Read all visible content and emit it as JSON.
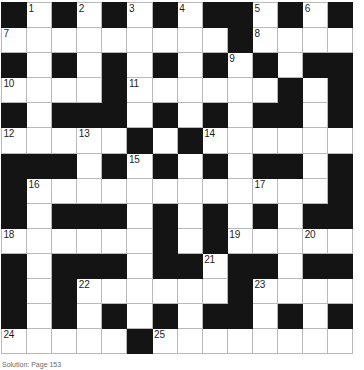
{
  "puzzle": {
    "kind": "crossword-grid",
    "rows": 14,
    "columns": 14,
    "cell_size_px": 25,
    "colors": {
      "block": "#141414",
      "cell": "#ffffff",
      "gridline": "#b9b9b9",
      "number": "#1d1d1d"
    },
    "legend": {
      "white": 0,
      "black": 1
    },
    "layout": [
      [
        1,
        0,
        1,
        0,
        1,
        0,
        1,
        0,
        1,
        1,
        0,
        1,
        0,
        1
      ],
      [
        0,
        0,
        0,
        0,
        0,
        0,
        0,
        0,
        0,
        1,
        0,
        0,
        0,
        0
      ],
      [
        1,
        0,
        1,
        0,
        1,
        0,
        1,
        0,
        1,
        0,
        1,
        0,
        1,
        1
      ],
      [
        0,
        0,
        0,
        0,
        1,
        0,
        0,
        0,
        0,
        0,
        0,
        1,
        0,
        1
      ],
      [
        1,
        0,
        1,
        1,
        1,
        0,
        1,
        0,
        1,
        0,
        1,
        1,
        0,
        1
      ],
      [
        0,
        0,
        0,
        0,
        0,
        1,
        0,
        1,
        0,
        0,
        0,
        0,
        0,
        0
      ],
      [
        1,
        1,
        1,
        0,
        1,
        0,
        1,
        0,
        1,
        0,
        1,
        1,
        0,
        1
      ],
      [
        1,
        0,
        0,
        0,
        0,
        0,
        0,
        0,
        0,
        0,
        0,
        0,
        0,
        1
      ],
      [
        1,
        0,
        1,
        1,
        1,
        0,
        1,
        0,
        1,
        0,
        1,
        0,
        1,
        1
      ],
      [
        0,
        0,
        0,
        0,
        0,
        0,
        1,
        0,
        1,
        0,
        0,
        0,
        0,
        0
      ],
      [
        1,
        0,
        1,
        1,
        1,
        0,
        1,
        1,
        0,
        1,
        1,
        0,
        1,
        1
      ],
      [
        1,
        0,
        1,
        0,
        0,
        0,
        0,
        0,
        0,
        1,
        0,
        0,
        0,
        0
      ],
      [
        1,
        0,
        1,
        0,
        1,
        0,
        1,
        0,
        1,
        1,
        0,
        1,
        0,
        1
      ],
      [
        0,
        0,
        0,
        0,
        0,
        1,
        0,
        0,
        0,
        0,
        0,
        0,
        0,
        0
      ]
    ],
    "numbers": [
      {
        "n": "1",
        "row": 0,
        "col": 1
      },
      {
        "n": "2",
        "row": 0,
        "col": 3
      },
      {
        "n": "3",
        "row": 0,
        "col": 5
      },
      {
        "n": "4",
        "row": 0,
        "col": 7
      },
      {
        "n": "5",
        "row": 0,
        "col": 10
      },
      {
        "n": "6",
        "row": 0,
        "col": 12
      },
      {
        "n": "7",
        "row": 1,
        "col": 0
      },
      {
        "n": "8",
        "row": 1,
        "col": 10
      },
      {
        "n": "9",
        "row": 2,
        "col": 9
      },
      {
        "n": "10",
        "row": 3,
        "col": 0
      },
      {
        "n": "11",
        "row": 3,
        "col": 5
      },
      {
        "n": "12",
        "row": 5,
        "col": 0
      },
      {
        "n": "13",
        "row": 5,
        "col": 3
      },
      {
        "n": "14",
        "row": 5,
        "col": 8
      },
      {
        "n": "15",
        "row": 6,
        "col": 5
      },
      {
        "n": "16",
        "row": 7,
        "col": 1
      },
      {
        "n": "17",
        "row": 7,
        "col": 10
      },
      {
        "n": "18",
        "row": 9,
        "col": 0
      },
      {
        "n": "19",
        "row": 9,
        "col": 9
      },
      {
        "n": "20",
        "row": 9,
        "col": 12
      },
      {
        "n": "21",
        "row": 10,
        "col": 8
      },
      {
        "n": "22",
        "row": 11,
        "col": 3
      },
      {
        "n": "23",
        "row": 11,
        "col": 10
      },
      {
        "n": "24",
        "row": 13,
        "col": 0
      },
      {
        "n": "25",
        "row": 13,
        "col": 6
      }
    ]
  },
  "caption": {
    "text": "Solution: Page 153"
  }
}
